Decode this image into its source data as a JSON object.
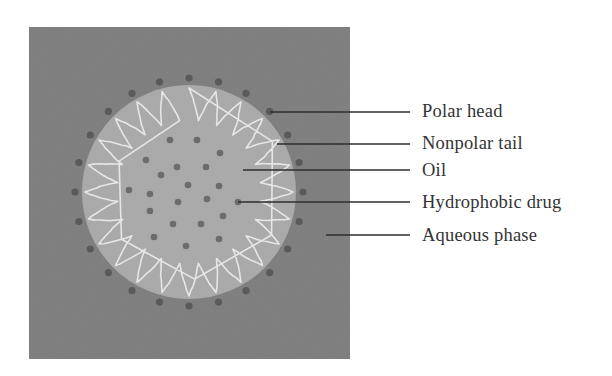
{
  "figure": {
    "colors": {
      "aqueous_phase": "#7b7b7b",
      "oil_core": "#a9a9a9",
      "polar_head": "#5a5a5a",
      "nonpolar_tail": "#e6e6e6",
      "drug": "#6c6c6c",
      "leader_line": "#2e2e2e",
      "label_text": "#333333"
    },
    "surfactant_count": 24,
    "drug_particle_count": 22
  },
  "labels": [
    {
      "id": "polar-head",
      "text": "Polar head"
    },
    {
      "id": "nonpolar-tail",
      "text": "Nonpolar tail"
    },
    {
      "id": "oil",
      "text": "Oil"
    },
    {
      "id": "hydrophobic-drug",
      "text": "Hydrophobic drug"
    },
    {
      "id": "aqueous-phase",
      "text": "Aqueous phase"
    }
  ]
}
